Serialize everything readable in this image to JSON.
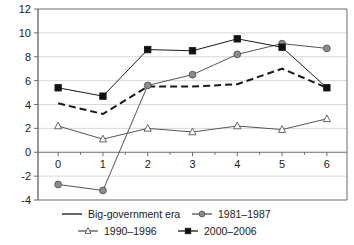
{
  "chart_data": {
    "type": "line",
    "title": "",
    "subtitle": "",
    "xlabel": "",
    "ylabel": "",
    "x": [
      0,
      1,
      2,
      3,
      4,
      5,
      6
    ],
    "xticklabels": [
      "0",
      "1",
      "2",
      "3",
      "4",
      "5",
      "6"
    ],
    "yticklabels": [
      "-4",
      "-2",
      "0",
      "2",
      "4",
      "6",
      "8",
      "10",
      "12"
    ],
    "yticks": [
      -4,
      -2,
      0,
      2,
      4,
      6,
      8,
      10,
      12
    ],
    "xlim": [
      -0.45,
      6.45
    ],
    "ylim": [
      -4,
      12
    ],
    "grid": true,
    "grid_axis": "y",
    "legend_position": "bottom",
    "series": [
      {
        "name": "Big-government era",
        "values": [
          4.1,
          3.2,
          5.5,
          5.5,
          5.7,
          7.0,
          5.4
        ],
        "marker": "none",
        "linestyle": "dashed",
        "color": "#1a1a1a"
      },
      {
        "name": "1981–1987",
        "values": [
          -2.7,
          -3.2,
          5.6,
          6.5,
          8.2,
          9.1,
          8.7
        ],
        "marker": "circle",
        "linestyle": "solid",
        "color": "#555555",
        "marker_fill": "#8c8c8c"
      },
      {
        "name": "1990–1996",
        "values": [
          2.2,
          1.1,
          2.0,
          1.7,
          2.2,
          1.9,
          2.8
        ],
        "marker": "triangle",
        "linestyle": "solid",
        "color": "#555555",
        "marker_fill": "#ffffff"
      },
      {
        "name": "2000–2006",
        "values": [
          5.4,
          4.7,
          8.6,
          8.5,
          9.5,
          8.8,
          5.4
        ],
        "marker": "square",
        "linestyle": "solid",
        "color": "#1a1a1a",
        "marker_fill": "#111111"
      }
    ]
  },
  "legend": {
    "entries": [
      {
        "label": "Big-government era",
        "marker": "line-icon"
      },
      {
        "label": "1981–1987",
        "marker": "circle-marker-icon"
      },
      {
        "label": "1990–1996",
        "marker": "triangle-marker-icon"
      },
      {
        "label": "2000–2006",
        "marker": "square-marker-icon"
      }
    ]
  },
  "colors": {
    "axis": "#6b6b6b",
    "grid": "#d8d8d8",
    "text": "#1a1a1a",
    "series_dark": "#1a1a1a",
    "series_gray": "#555555",
    "marker_gray_fill": "#8c8c8c",
    "marker_white_fill": "#ffffff",
    "background": "#ffffff"
  }
}
